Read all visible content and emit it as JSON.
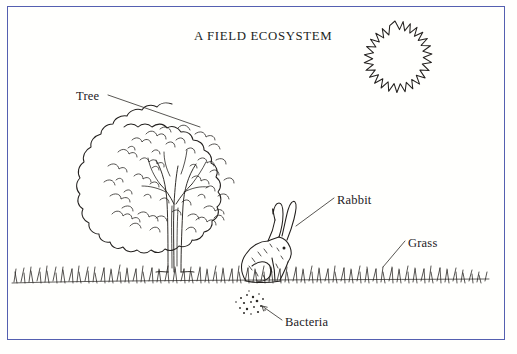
{
  "diagram": {
    "title": "A FIELD ECOSYSTEM",
    "border_color": "#5560b0",
    "ink_color": "#23201e",
    "background_color": "#fffffd",
    "type": "hand-drawn ecosystem illustration",
    "labels": [
      {
        "id": "tree",
        "text": "Tree",
        "x": 76,
        "y": 90,
        "leader": "line",
        "points_to": "tree-canopy"
      },
      {
        "id": "rabbit",
        "text": "Rabbit",
        "x": 337,
        "y": 194,
        "leader": "line",
        "points_to": "rabbit-ears"
      },
      {
        "id": "grass",
        "text": "Grass",
        "x": 408,
        "y": 237,
        "leader": "line",
        "points_to": "grass-band"
      },
      {
        "id": "bacteria",
        "text": "Bacteria",
        "x": 285,
        "y": 316,
        "leader": "arrow",
        "points_to": "bacteria-cluster"
      }
    ],
    "elements": [
      {
        "id": "sun",
        "name": "sun",
        "x": 395,
        "y": 58,
        "description": "spiky ring outline of the sun in the upper right"
      },
      {
        "id": "tree",
        "name": "tree",
        "x": 175,
        "y": 190,
        "description": "broadleaf tree with cloud-shaped scribbled canopy and forked trunk"
      },
      {
        "id": "rabbit",
        "name": "rabbit",
        "x": 268,
        "y": 248,
        "description": "rabbit sitting on the grass facing right with two upright ears"
      },
      {
        "id": "grass",
        "name": "grass",
        "x": 250,
        "y": 282,
        "description": "band of grass blades running across the whole scene"
      },
      {
        "id": "bacteria",
        "name": "bacteria",
        "x": 252,
        "y": 304,
        "description": "cluster of small dots representing bacteria in the soil"
      }
    ]
  }
}
